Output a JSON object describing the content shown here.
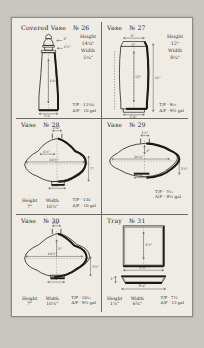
{
  "document": {
    "kind": "handwritten-pottery-shape-catalogue-page",
    "paper_color": "#efece5",
    "ink_color": "#2b2a28",
    "background_color": "#c9c6bf"
  },
  "cells": [
    {
      "id": "vase-26",
      "title_object": "Covered Vase",
      "title_number": "№ 26",
      "shape": "tall-tapering-covered-vase",
      "specs": [
        {
          "label": "Height",
          "value": "14¾\""
        },
        {
          "label": "Width",
          "value": "5¼\""
        }
      ],
      "codes": [
        "T/P · 11½⁄₆",
        "A/F · 10 gal"
      ],
      "dim_labels": [
        "4\"",
        "4½\"",
        "14¾\"",
        "5¼\""
      ]
    },
    {
      "id": "vase-27",
      "title_object": "Vase",
      "title_number": "№ 27",
      "shape": "tall-barrel-vase",
      "specs": [
        {
          "label": "Height",
          "value": "12\""
        },
        {
          "label": "Width",
          "value": "8¼\""
        }
      ],
      "codes": [
        "T/P · 9⁄₁₀",
        "A/F · 9½ gal"
      ],
      "dim_labels": [
        "4\"",
        "3\"",
        "12\"",
        "11\"",
        "5¼\""
      ]
    },
    {
      "id": "vase-28",
      "title_object": "Vase",
      "title_number": "№ 28",
      "shape": "wide-flat-flared-vase",
      "specs": [
        {
          "label": "Height",
          "value": "7\""
        },
        {
          "label": "Width",
          "value": "10½\""
        }
      ],
      "codes": [
        "T/P · 13⁄₆",
        "A/F · 10 gal"
      ],
      "dim_labels": [
        "2¼\"",
        "10½\"",
        "4½\"",
        "7\"",
        "3½\""
      ]
    },
    {
      "id": "vase-29",
      "title_object": "Vase",
      "title_number": "№ 29",
      "shape": "lens-disc-vase",
      "specs": [],
      "codes": [
        "T/P · 7⁄₁₀",
        "A/F · 8¼ gal"
      ],
      "dim_labels": [
        "1½\"",
        "4\"",
        "10¼\"",
        "3¼\"",
        "3½\""
      ]
    },
    {
      "id": "vase-30",
      "title_object": "Vase",
      "title_number": "№ 30",
      "shape": "broad-shouldered-flared-vase",
      "specs": [
        {
          "label": "Height",
          "value": "7\""
        },
        {
          "label": "Width",
          "value": "10½\""
        }
      ],
      "codes": [
        "T/P · 10⁄₁₂",
        "A/F · 9½ gal"
      ],
      "dim_labels": [
        "2¼\"",
        "10½\"",
        "5\"",
        "3½\"",
        "3¼\""
      ]
    },
    {
      "id": "tray-31",
      "title_object": "Tray",
      "title_number": "№ 31",
      "shape": "square-tray-plan-and-elevation",
      "specs": [
        {
          "label": "Height",
          "value": "1½\""
        },
        {
          "label": "Width",
          "value": "6¾\""
        }
      ],
      "codes": [
        "T/P · 7½",
        "A/F · 13 gal"
      ],
      "dim_labels": [
        "4½\"",
        "4½\"",
        "1\"",
        "6¼\""
      ]
    }
  ]
}
